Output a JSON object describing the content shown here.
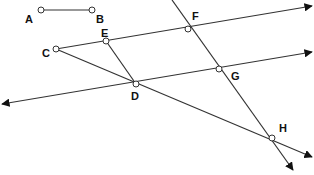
{
  "diagram": {
    "colors": {
      "line": "#333333",
      "point_fill": "#ffffff",
      "label": "#111111"
    },
    "points": {
      "A": {
        "label": "A",
        "x": 41,
        "y": 10
      },
      "B": {
        "label": "B",
        "x": 92,
        "y": 10
      },
      "C": {
        "label": "C",
        "x": 56,
        "y": 49
      },
      "D": {
        "label": "D",
        "x": 136,
        "y": 84
      },
      "E": {
        "label": "E",
        "x": 106,
        "y": 41
      },
      "F": {
        "label": "F",
        "x": 188,
        "y": 29
      },
      "G": {
        "label": "G",
        "x": 219,
        "y": 69
      },
      "H": {
        "label": "H",
        "x": 272,
        "y": 138
      }
    },
    "segments": [
      {
        "name": "segment-AB",
        "from": "A",
        "to": "B"
      }
    ],
    "rays": [
      {
        "name": "ray-CEF",
        "from": "C",
        "through": [
          "E",
          "F"
        ],
        "arrow": "right"
      },
      {
        "name": "line-DG",
        "through": [
          "D",
          "G"
        ],
        "arrow": "both"
      },
      {
        "name": "ray-CDH",
        "from": "C",
        "through": [
          "D",
          "H"
        ],
        "arrow": "down-right"
      },
      {
        "name": "ray-ED",
        "from": "E",
        "through": [
          "D"
        ]
      },
      {
        "name": "line-FGH",
        "through": [
          "F",
          "G",
          "H"
        ],
        "arrow": "down"
      }
    ]
  }
}
